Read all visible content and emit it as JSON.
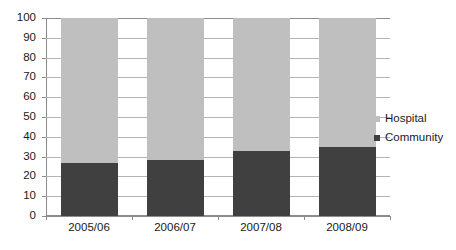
{
  "chart_data": {
    "type": "bar",
    "stacked": true,
    "title": "",
    "subtitle": "",
    "xlabel": "",
    "ylabel": "",
    "categories": [
      "2005/06",
      "2006/07",
      "2007/08",
      "2008/09"
    ],
    "series": [
      {
        "name": "Hospital",
        "values": [
          73,
          71.5,
          67,
          65
        ],
        "color": "#bfbfbf"
      },
      {
        "name": "Community",
        "values": [
          27,
          28.5,
          33,
          35
        ],
        "color": "#404040"
      }
    ],
    "stack_order_bottom_to_top": [
      "Community",
      "Hospital"
    ],
    "ylim": [
      0,
      100
    ],
    "ytick_step": 10,
    "ytick_labels": [
      "0",
      "10",
      "20",
      "30",
      "40",
      "50",
      "60",
      "70",
      "80",
      "90",
      "100"
    ],
    "grid": true,
    "grid_axis": "y",
    "legend_position": "right",
    "legend": [
      {
        "label": "Hospital",
        "color": "#bfbfbf"
      },
      {
        "label": "Community",
        "color": "#404040"
      }
    ],
    "annotations": []
  },
  "colors": {
    "hospital": "#bfbfbf",
    "community": "#404040",
    "gridline": "#b4b4b4",
    "axis": "#8c8c8c",
    "text": "#1a1a1a",
    "background": "#ffffff"
  }
}
